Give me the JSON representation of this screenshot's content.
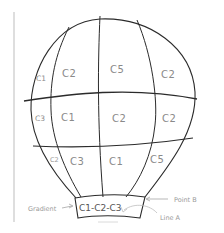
{
  "diagram": {
    "type": "hand-drawn sketch",
    "colors": {
      "line": "#2b2b2b",
      "label": "#8a8a8a",
      "annotation": "#9a9a9a",
      "margin_line": "#b5b5b5",
      "background": "#ffffff"
    },
    "envelope": {
      "rows": [
        {
          "name": "top-row",
          "cells": [
            {
              "label": "C1",
              "column": "left-edge"
            },
            {
              "label": "C2",
              "column": "left-center"
            },
            {
              "label": "C5",
              "column": "right-center"
            },
            {
              "label": "C2",
              "column": "right"
            }
          ]
        },
        {
          "name": "middle-row",
          "cells": [
            {
              "label": "C3",
              "column": "left-edge"
            },
            {
              "label": "C1",
              "column": "left-center"
            },
            {
              "label": "C2",
              "column": "right-center"
            },
            {
              "label": "C2",
              "column": "right"
            }
          ]
        },
        {
          "name": "bottom-row",
          "cells": [
            {
              "label": "C2",
              "column": "left-edge"
            },
            {
              "label": "C3",
              "column": "left-center"
            },
            {
              "label": "C1",
              "column": "right-center"
            },
            {
              "label": "C5",
              "column": "right"
            }
          ]
        }
      ]
    },
    "basket": {
      "label": "C1-C2-C3"
    },
    "annotations": [
      {
        "name": "gradient",
        "text": "Gradient",
        "points_to": "basket-left"
      },
      {
        "name": "point-b",
        "text": "Point B",
        "points_to": "basket-top-right-corner"
      },
      {
        "name": "line-a",
        "text": "Line A",
        "points_to": "basket-interior"
      }
    ]
  }
}
